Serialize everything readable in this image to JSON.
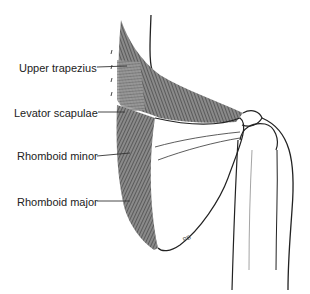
{
  "figure": {
    "labels": [
      {
        "id": "upper-trapezius",
        "text": "Upper trapezius",
        "x": 19,
        "y": 62
      },
      {
        "id": "levator-scapulae",
        "text": "Levator scapulae",
        "x": 14,
        "y": 107
      },
      {
        "id": "rhomboid-minor",
        "text": "Rhomboid minor",
        "x": 17,
        "y": 150
      },
      {
        "id": "rhomboid-major",
        "text": "Rhomboid major",
        "x": 17,
        "y": 196
      }
    ],
    "signature": "PB",
    "colors": {
      "line": "#222222",
      "muscle_dark": "#6e6e6e",
      "muscle_light": "#9a9a9a",
      "background": "#ffffff"
    }
  }
}
